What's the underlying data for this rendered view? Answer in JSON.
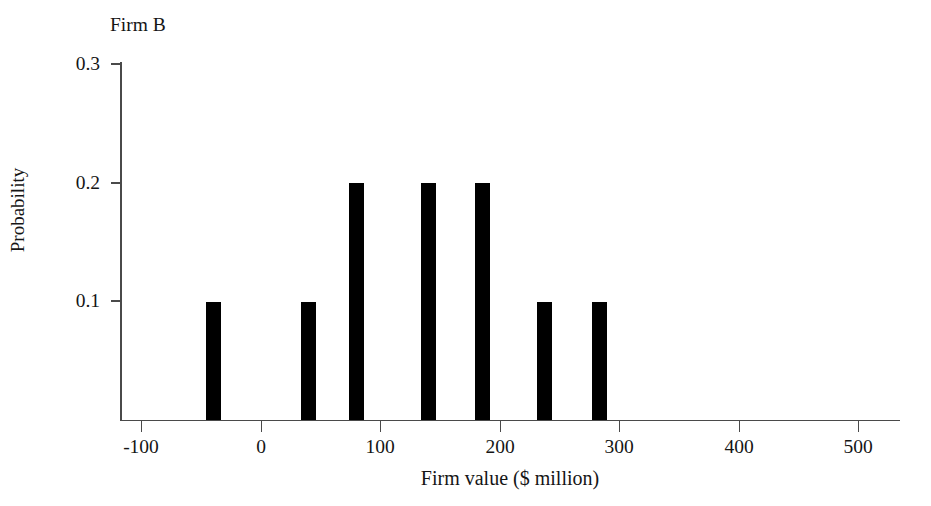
{
  "figure": {
    "title": "Firm B",
    "background_color": "#ffffff",
    "axis_color": "#4a4a4a",
    "bar_color": "#000000"
  },
  "axes": {
    "x_title": "Firm value ($ million)",
    "y_title": "Probability",
    "x_ticks": [
      "-100",
      "0",
      "100",
      "200",
      "300",
      "400",
      "500"
    ],
    "y_ticks": [
      "0.1",
      "0.2",
      "0.3"
    ]
  },
  "chart_data": {
    "type": "bar",
    "title": "Firm B",
    "xlabel": "Firm value ($ million)",
    "ylabel": "Probability",
    "x": [
      -40,
      40,
      80,
      140,
      185,
      237,
      283
    ],
    "values": [
      0.1,
      0.1,
      0.2,
      0.2,
      0.2,
      0.1,
      0.1
    ],
    "categories": [
      "-40",
      "40",
      "80",
      "140",
      "185",
      "237",
      "283"
    ],
    "xlim": [
      -130,
      520
    ],
    "ylim": [
      0,
      0.305
    ],
    "x_tick_values": [
      -100,
      0,
      100,
      200,
      300,
      400,
      500
    ],
    "y_tick_values": [
      0.1,
      0.2,
      0.3
    ],
    "grid": false,
    "legend": false,
    "bar_width_units": 13,
    "annotations": [
      "Firm B"
    ]
  }
}
